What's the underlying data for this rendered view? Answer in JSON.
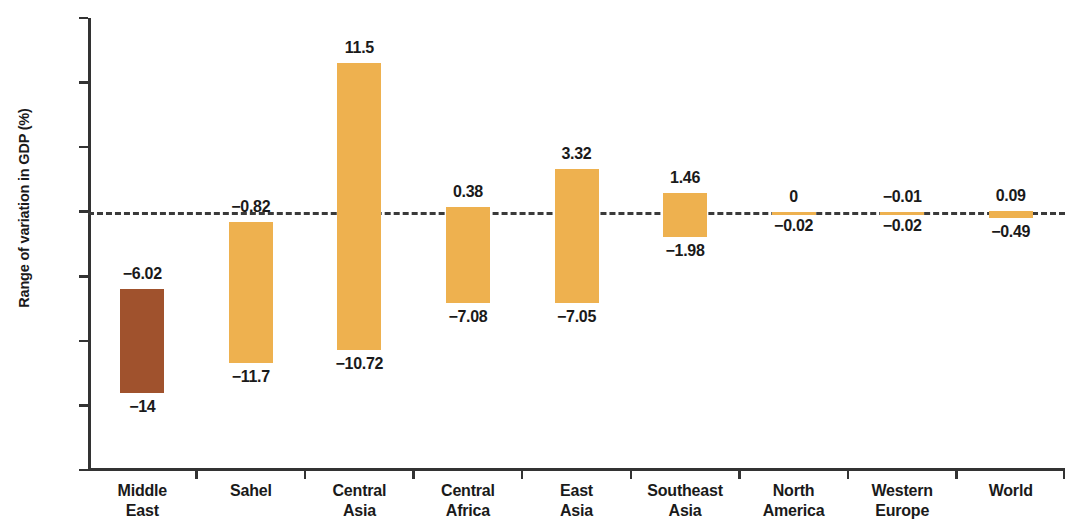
{
  "chart_data": {
    "type": "bar",
    "title": "",
    "subtitle": "",
    "xlabel": "",
    "ylabel": "Range of variation in GDP (%)",
    "ylim": [
      -20,
      15
    ],
    "yticks": [
      15,
      10,
      5,
      0,
      -5,
      -10,
      -15,
      -20
    ],
    "ytick_labels": [
      "15",
      "10",
      "5",
      "0",
      "−5",
      "−10",
      "−15",
      "−20"
    ],
    "grid": false,
    "legend": null,
    "zero_line": {
      "value": 0,
      "style": "dashed",
      "color": "#3a3a3a"
    },
    "note": "Floating range bars: each category spans from a low value to a high value around zero.",
    "categories": [
      "Middle East",
      "Sahel",
      "Central Asia",
      "Central Africa",
      "East Asia",
      "Southeast Asia",
      "North America",
      "Western Europe",
      "World"
    ],
    "category_lines": [
      [
        "Middle",
        "East"
      ],
      [
        "Sahel"
      ],
      [
        "Central",
        "Asia"
      ],
      [
        "Central",
        "Africa"
      ],
      [
        "East",
        "Asia"
      ],
      [
        "Southeast",
        "Asia"
      ],
      [
        "North",
        "America"
      ],
      [
        "Western",
        "Europe"
      ],
      [
        "World"
      ]
    ],
    "series": [
      {
        "name": "high",
        "values": [
          -6.02,
          -0.82,
          11.5,
          0.38,
          3.32,
          1.46,
          0,
          -0.01,
          0.09
        ],
        "labels": [
          "−6.02",
          "−0.82",
          "11.5",
          "0.38",
          "3.32",
          "1.46",
          "0",
          "−0.01",
          "0.09"
        ]
      },
      {
        "name": "low",
        "values": [
          -14,
          -11.7,
          -10.72,
          -7.08,
          -7.05,
          -1.98,
          -0.02,
          -0.02,
          -0.49
        ],
        "labels": [
          "−14",
          "−11.7",
          "−10.72",
          "−7.08",
          "−7.05",
          "−1.98",
          "−0.02",
          "−0.02",
          "−0.49"
        ]
      }
    ],
    "bar_colors": [
      "#a0522d",
      "#eeb14f",
      "#eeb14f",
      "#eeb14f",
      "#eeb14f",
      "#eeb14f",
      "#eeb14f",
      "#eeb14f",
      "#eeb14f"
    ],
    "colors": {
      "highlight": "#a0522d",
      "default": "#eeb14f",
      "axis": "#333333",
      "text": "#1a1a1a",
      "background": "#ffffff"
    }
  }
}
